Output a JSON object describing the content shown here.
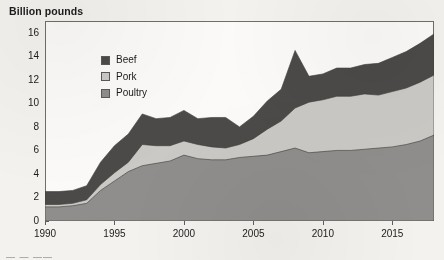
{
  "chart_title": "Billion pounds",
  "legend": {
    "position": "top-left inside plot",
    "items": [
      {
        "label": "Beef",
        "color": "#4b4a48"
      },
      {
        "label": "Pork",
        "color": "#cac9c6"
      },
      {
        "label": "Poultry",
        "color": "#8f8e8c"
      }
    ]
  },
  "axes": {
    "y_ticks": [
      "16",
      "14",
      "12",
      "10",
      "8",
      "6",
      "4",
      "2",
      "0"
    ],
    "x_ticks": [
      "1990",
      "1995",
      "2000",
      "2005",
      "2010",
      "2015"
    ]
  },
  "footer_fragment": "— — —— —",
  "chart_data": {
    "type": "area",
    "stacked": true,
    "title": "Billion pounds",
    "xlabel": "",
    "ylabel": "Billion pounds",
    "ylim": [
      0,
      17
    ],
    "xlim": [
      1990,
      2018
    ],
    "grid": false,
    "legend_position": "upper left",
    "x": [
      1990,
      1991,
      1992,
      1993,
      1994,
      1995,
      1996,
      1997,
      1998,
      1999,
      2000,
      2001,
      2002,
      2003,
      2004,
      2005,
      2006,
      2007,
      2008,
      2009,
      2010,
      2011,
      2012,
      2013,
      2014,
      2015,
      2016,
      2017,
      2018
    ],
    "series": [
      {
        "name": "Poultry",
        "color": "#8f8e8c",
        "values": [
          1.2,
          1.2,
          1.3,
          1.5,
          2.6,
          3.4,
          4.2,
          4.7,
          4.9,
          5.1,
          5.6,
          5.3,
          5.2,
          5.2,
          5.4,
          5.5,
          5.6,
          5.9,
          6.2,
          5.8,
          5.9,
          6.0,
          6.0,
          6.1,
          6.2,
          6.3,
          6.5,
          6.8,
          7.3
        ]
      },
      {
        "name": "Pork",
        "color": "#cac9c6",
        "values": [
          0.2,
          0.2,
          0.2,
          0.3,
          0.5,
          0.7,
          0.8,
          1.8,
          1.5,
          1.3,
          1.2,
          1.2,
          1.1,
          1.0,
          1.1,
          1.5,
          2.2,
          2.6,
          3.4,
          4.3,
          4.4,
          4.6,
          4.6,
          4.7,
          4.5,
          4.7,
          4.8,
          5.0,
          5.1
        ]
      },
      {
        "name": "Beef",
        "color": "#4b4a48",
        "values": [
          1.1,
          1.1,
          1.1,
          1.2,
          1.9,
          2.3,
          2.4,
          2.6,
          2.3,
          2.4,
          2.6,
          2.2,
          2.5,
          2.6,
          1.5,
          1.9,
          2.4,
          2.7,
          4.9,
          2.2,
          2.2,
          2.4,
          2.4,
          2.5,
          2.7,
          2.9,
          3.1,
          3.3,
          3.5
        ]
      }
    ],
    "totals": [
      2.5,
      2.5,
      2.6,
      3.0,
      5.0,
      6.4,
      7.4,
      9.1,
      8.7,
      8.8,
      9.4,
      8.7,
      8.8,
      8.8,
      8.0,
      8.9,
      10.2,
      11.2,
      14.5,
      12.3,
      12.5,
      13.0,
      13.0,
      13.3,
      13.4,
      13.9,
      14.4,
      15.1,
      15.9
    ]
  }
}
